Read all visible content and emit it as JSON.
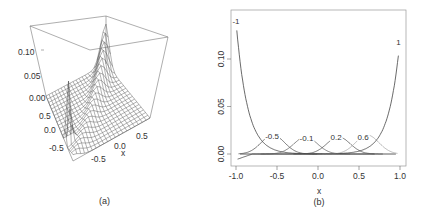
{
  "chart_data": [
    {
      "id": "a",
      "type": "surface",
      "caption": "(a)",
      "z_ticks": [
        "0.10",
        "0.05",
        "0.00"
      ],
      "y_ticks": [
        "0.5",
        "0.0",
        "-0.5"
      ],
      "x_ticks": [
        "-0.5",
        "0.0",
        "0.5"
      ],
      "xlabel": "x",
      "zlim": [
        0,
        0.12
      ],
      "description": "3D wireframe perspective surface; sharp spike near x=-1 corner and a ridge along the diagonal"
    },
    {
      "id": "b",
      "type": "line",
      "caption": "(b)",
      "xlabel": "x",
      "ylabel": "",
      "xlim": [
        -1.0,
        1.0
      ],
      "ylim": [
        -0.008,
        0.145
      ],
      "x_ticks": [
        "-1.0",
        "-0.5",
        "0.0",
        "0.5",
        "1.0"
      ],
      "y_ticks": [
        "0.00",
        "0.05",
        "0.10"
      ],
      "grid": false,
      "series": [
        {
          "name": "-1",
          "label": "-1",
          "color": "#444444",
          "center": -1.0,
          "peak": 0.14
        },
        {
          "name": "-0.5",
          "label": "-0.5",
          "color": "#555555",
          "center": -0.55,
          "peak": 0.02
        },
        {
          "name": "-0.1",
          "label": "-0.1",
          "color": "#666666",
          "center": -0.15,
          "peak": 0.018
        },
        {
          "name": "0.2",
          "label": "0.2",
          "color": "#555555",
          "center": 0.25,
          "peak": 0.018
        },
        {
          "name": "0.6",
          "label": "0.6",
          "color": "#aaaaaa",
          "center": 0.6,
          "peak": 0.02
        },
        {
          "name": "1",
          "label": "1",
          "color": "#444444",
          "center": 1.0,
          "peak": 0.12
        }
      ],
      "baseline": 0.0
    }
  ]
}
